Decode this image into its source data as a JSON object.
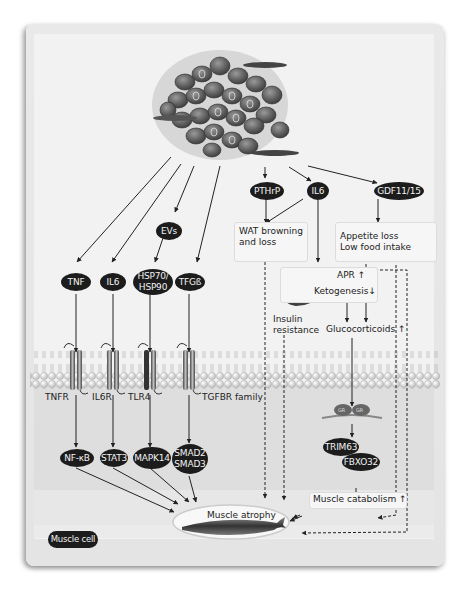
{
  "figure": {
    "tumor": {
      "label": "Tumor cells"
    },
    "secreted_factors": [
      {
        "id": "tnf",
        "label": "TNF"
      },
      {
        "id": "il6_left",
        "label": "IL6"
      },
      {
        "id": "evs",
        "label": "EVs"
      },
      {
        "id": "hsp",
        "label_line1": "HSP70/",
        "label_line2": "HSP90"
      },
      {
        "id": "tgfb",
        "label": "TFGß"
      },
      {
        "id": "pthrp",
        "label": "PTHrP"
      },
      {
        "id": "il6_right",
        "label": "IL6"
      },
      {
        "id": "gdf",
        "label": "GDF11/15"
      }
    ],
    "systemic_effects": {
      "wat": {
        "line1": "WAT browning",
        "line2": "and loss"
      },
      "appetite": {
        "line1": "Appetite loss",
        "line2": "Low food intake"
      },
      "liver": {
        "apr": "APR ↑",
        "ketogenesis": "Ketogenesis↓"
      },
      "insulin": {
        "line1": "Insulin",
        "line2": "resistance"
      },
      "glucocorticoids": "Glucocorticoids ↑"
    },
    "receptors": [
      {
        "id": "tnfr",
        "label": "TNFR"
      },
      {
        "id": "il6r",
        "label": "IL6R"
      },
      {
        "id": "tlr4",
        "label": "TLR4"
      },
      {
        "id": "tgfbr",
        "label": "TGFBR family"
      }
    ],
    "intracellular": [
      {
        "id": "nfkb",
        "label": "NF-κB"
      },
      {
        "id": "stat3",
        "label": "STAT3"
      },
      {
        "id": "mapk14",
        "label": "MAPK14"
      },
      {
        "id": "smad",
        "label_line1": "SMAD2",
        "label_line2": "SMAD3"
      },
      {
        "id": "gr",
        "label": "GR"
      },
      {
        "id": "trim63",
        "label": "TRIM63"
      },
      {
        "id": "fbxo32",
        "label": "FBXO32"
      }
    ],
    "outcomes": {
      "muscle_catabolism": "Muscle catabolism ↑",
      "muscle_atrophy": "Muscle atrophy"
    },
    "legend": {
      "muscle_cell": "Muscle cell"
    },
    "colors": {
      "pill_bg": "#1c1c1c",
      "pill_text": "#f2f2f2",
      "background": "#f2f2f2",
      "muscle_zone": "#dcdcdc",
      "arrow": "#222222"
    }
  }
}
